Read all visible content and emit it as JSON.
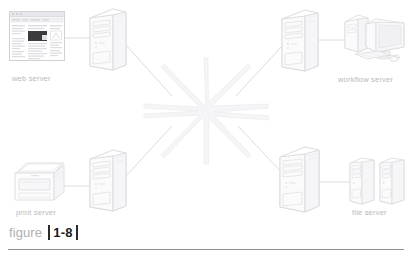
{
  "figure": {
    "caption_word": "figure",
    "caption_number": "1-8",
    "bar_color": "#2b2b2b",
    "rule_color": "#8f8f92",
    "background": "#ffffff",
    "line_color": "#d8d8dc",
    "art_stroke": "#dcdce0",
    "label_color": "#b9b9bb"
  },
  "diagram": {
    "center": {
      "name": "network-starburst",
      "icon": "starburst-icon",
      "rays": 8
    },
    "nodes": [
      {
        "id": "web-server",
        "label": "web server",
        "device_icon": "browser-window-icon",
        "server_icon": "tower-computer-icon",
        "position": "top-left",
        "connected_to": "network-starburst"
      },
      {
        "id": "workflow-server",
        "label": "workflow server",
        "device_icon": "desktop-computer-icon",
        "server_icon": "tower-computer-icon",
        "position": "top-right",
        "connected_to": "network-starburst"
      },
      {
        "id": "print-server",
        "label": "print server",
        "device_icon": "printer-icon",
        "server_icon": "tower-computer-icon",
        "position": "bottom-left",
        "connected_to": "network-starburst"
      },
      {
        "id": "file-server",
        "label": "file server",
        "device_icon": "disk-tower-pair-icon",
        "server_icon": "tower-computer-icon",
        "position": "bottom-right",
        "connected_to": "network-starburst"
      }
    ]
  }
}
